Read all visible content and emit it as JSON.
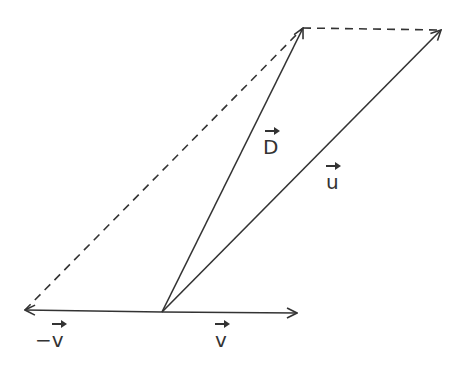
{
  "diagram": {
    "colors": {
      "stroke": "#333333",
      "background": "#ffffff"
    },
    "points": {
      "origin": [
        162,
        312
      ],
      "v_head": [
        297,
        313
      ],
      "neg_v_head": [
        25,
        310
      ],
      "D_head": [
        303,
        28
      ],
      "u_head": [
        441,
        30
      ]
    },
    "vectors": [
      {
        "id": "v",
        "label": "v",
        "from": "origin",
        "to": "v_head",
        "style": "solid"
      },
      {
        "id": "neg_v",
        "label": "−v",
        "from": "origin",
        "to": "neg_v_head",
        "style": "solid"
      },
      {
        "id": "D",
        "label": "D",
        "from": "origin",
        "to": "D_head",
        "style": "solid"
      },
      {
        "id": "u",
        "label": "u",
        "from": "origin",
        "to": "u_head",
        "style": "solid"
      }
    ],
    "dashed_lines": [
      {
        "from": "neg_v_head",
        "to": "D_head"
      },
      {
        "from": "D_head",
        "to": "u_head"
      }
    ],
    "labels": {
      "D": "D",
      "u": "u",
      "v": "v",
      "neg_v_sign": "−",
      "neg_v": "v"
    }
  }
}
